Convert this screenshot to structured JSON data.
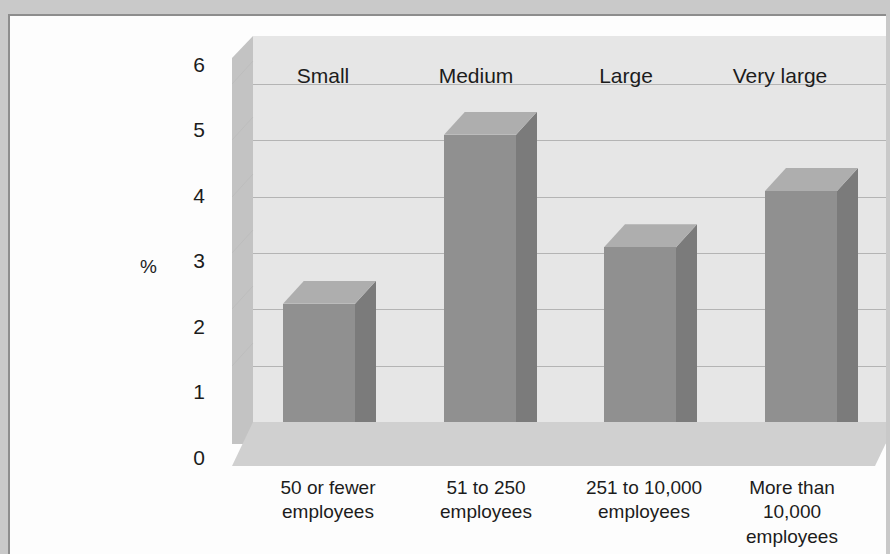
{
  "figure": {
    "background_color": "#c9c9c9",
    "card_color": "#fdfdfd"
  },
  "chart_data": {
    "type": "bar",
    "title": "",
    "subtitle": "",
    "xlabel": "",
    "ylabel": "%",
    "ylim": [
      0,
      6
    ],
    "yticks": [
      "0",
      "1",
      "2",
      "3",
      "4",
      "5",
      "6"
    ],
    "grid": true,
    "legend_position": "none",
    "three_d": true,
    "categories": [
      "50 or fewer\nemployees",
      "51 to 250\nemployees",
      "251 to 10,000\nemployees",
      "More than\n10,000\nemployees"
    ],
    "series_labels": [
      "Small",
      "Medium",
      "Large",
      "Very large"
    ],
    "values": [
      2.1,
      5.1,
      3.1,
      4.1
    ],
    "series": [
      {
        "name": "%",
        "values": [
          2.1,
          5.1,
          3.1,
          4.1
        ]
      }
    ],
    "colors": {
      "bar_front": "#909090",
      "bar_side": "#7b7b7b",
      "bar_top": "#aeaeae",
      "back_wall": "#e6e6e6",
      "left_wall": "#c3c3c3",
      "floor": "#d0d0d0",
      "gridline": "#b4b4b4",
      "text": "#1c1c1c"
    }
  },
  "axis": {
    "y": {
      "tick_0": "0",
      "tick_1": "1",
      "tick_2": "2",
      "tick_3": "3",
      "tick_4": "4",
      "tick_5": "5",
      "tick_6": "6",
      "label": "%"
    }
  },
  "bands": {
    "small": "Small",
    "medium": "Medium",
    "large": "Large",
    "very_large": "Very large"
  },
  "categories": {
    "c0": "50 or fewer\nemployees",
    "c1": "51 to 250\nemployees",
    "c2": "251 to 10,000\nemployees",
    "c3": "More than\n10,000\nemployees"
  }
}
